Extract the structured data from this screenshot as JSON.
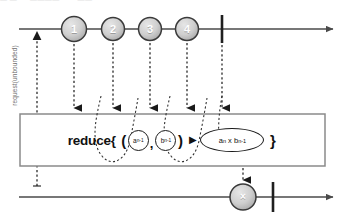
{
  "diagram": {
    "type": "marble-diagram",
    "operator": "reduce",
    "title_noise": "—  —   ···   ————   ·· ·· ——"
  },
  "source_timeline": {
    "name": "source-observable",
    "marbles": [
      {
        "label": "1",
        "cx": 74,
        "cy": 29,
        "r": 12.5
      },
      {
        "label": "2",
        "cx": 113,
        "cy": 29,
        "r": 11.5
      },
      {
        "label": "3",
        "cx": 150,
        "cy": 29,
        "r": 11.5
      },
      {
        "label": "4",
        "cx": 187,
        "cy": 29,
        "r": 11.5
      }
    ],
    "complete_bar_x": 222,
    "line_y": 29,
    "line_start_x": 19,
    "line_end_x": 338
  },
  "backpressure": {
    "label": "request(unbounded)",
    "arrow_x": 37,
    "arrow_top_y": 33,
    "arrow_bottom_y": 186
  },
  "operator_box": {
    "name": "reduce-box",
    "x": 20,
    "y": 114,
    "width": 305,
    "height": 52,
    "expression": {
      "keyword": "reduce{",
      "open_paren": "(",
      "accumulator": {
        "base": "a",
        "sub": "n-1"
      },
      "separator": ",",
      "value": {
        "base": "b",
        "sub": "n-1"
      },
      "close_paren": ")",
      "arrow": "▶",
      "result": {
        "left_base": "a",
        "left_sub": "n",
        "times": "x",
        "right_base": "b",
        "right_sub": "n-1"
      },
      "close_brace": "}"
    }
  },
  "output_timeline": {
    "name": "result-observable",
    "marbles": [
      {
        "label": "×",
        "cx": 243,
        "cy": 197,
        "r": 13
      }
    ],
    "complete_bar_x": 273,
    "line_y": 197,
    "line_start_x": 19,
    "line_end_x": 338
  },
  "colors": {
    "marble_fill_light": "#d8d8d8",
    "marble_fill_dark": "#a8a8a8",
    "marble_stroke": "#3a3a3a",
    "line": "#4a4a4a",
    "box_stroke": "#8a8a8a",
    "dashed": "#2b2b2b",
    "text": "#111111",
    "label_gray": "#6f6f6f"
  }
}
